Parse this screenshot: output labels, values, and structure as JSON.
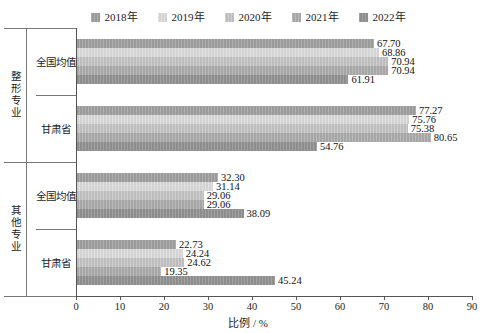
{
  "chart_data": {
    "type": "bar",
    "orientation": "horizontal",
    "title": "",
    "xlabel": "比例 / %",
    "ylabel": "",
    "xlim": [
      0,
      90
    ],
    "xticks": [
      0,
      10,
      20,
      30,
      40,
      50,
      60,
      70,
      80,
      90
    ],
    "grid": false,
    "legend_position": "top-center",
    "legend": [
      "2018年",
      "2019年",
      "2020年",
      "2021年",
      "2022年"
    ],
    "series": [
      {
        "name": "2018年",
        "color": "#9a9a9a",
        "values": [
          67.7,
          77.27,
          32.3,
          22.73
        ]
      },
      {
        "name": "2019年",
        "color": "#d3d3d3",
        "values": [
          68.86,
          75.76,
          31.14,
          24.24
        ]
      },
      {
        "name": "2020年",
        "color": "#bdbdbd",
        "values": [
          70.94,
          75.38,
          29.06,
          24.62
        ]
      },
      {
        "name": "2021年",
        "color": "#a6a6a6",
        "values": [
          70.94,
          80.65,
          29.06,
          19.35
        ]
      },
      {
        "name": "2022年",
        "color": "#8d8d8d",
        "values": [
          61.91,
          54.76,
          38.09,
          45.24
        ]
      }
    ],
    "categories": [
      "全国均值",
      "甘肃省",
      "全国均值",
      "甘肃省"
    ],
    "group_labels": [
      "整形专业",
      "其他专业"
    ],
    "groups": [
      {
        "group": "整形专业",
        "category": "全国均值",
        "bars": [
          {
            "series": "2018年",
            "value": 67.7,
            "label": "67.70"
          },
          {
            "series": "2019年",
            "value": 68.86,
            "label": "68.86"
          },
          {
            "series": "2020年",
            "value": 70.94,
            "label": "70.94"
          },
          {
            "series": "2021年",
            "value": 70.94,
            "label": "70.94"
          },
          {
            "series": "2022年",
            "value": 61.91,
            "label": "61.91"
          }
        ]
      },
      {
        "group": "整形专业",
        "category": "甘肃省",
        "bars": [
          {
            "series": "2018年",
            "value": 77.27,
            "label": "77.27"
          },
          {
            "series": "2019年",
            "value": 75.76,
            "label": "75.76"
          },
          {
            "series": "2020年",
            "value": 75.38,
            "label": "75.38"
          },
          {
            "series": "2021年",
            "value": 80.65,
            "label": "80.65"
          },
          {
            "series": "2022年",
            "value": 54.76,
            "label": "54.76"
          }
        ]
      },
      {
        "group": "其他专业",
        "category": "全国均值",
        "bars": [
          {
            "series": "2018年",
            "value": 32.3,
            "label": "32.30"
          },
          {
            "series": "2019年",
            "value": 31.14,
            "label": "31.14"
          },
          {
            "series": "2020年",
            "value": 29.06,
            "label": "29.06"
          },
          {
            "series": "2021年",
            "value": 29.06,
            "label": "29.06"
          },
          {
            "series": "2022年",
            "value": 38.09,
            "label": "38.09"
          }
        ]
      },
      {
        "group": "其他专业",
        "category": "甘肃省",
        "bars": [
          {
            "series": "2018年",
            "value": 22.73,
            "label": "22.73"
          },
          {
            "series": "2019年",
            "value": 24.24,
            "label": "24.24"
          },
          {
            "series": "2020年",
            "value": 24.62,
            "label": "24.62"
          },
          {
            "series": "2021年",
            "value": 19.35,
            "label": "19.35"
          },
          {
            "series": "2022年",
            "value": 45.24,
            "label": "45.24"
          }
        ]
      }
    ]
  }
}
